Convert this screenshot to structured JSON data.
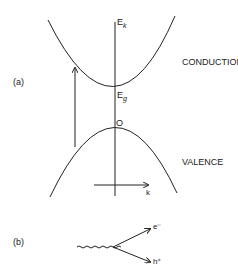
{
  "panel_a": {
    "label": "(a)",
    "energy_axis_label": "E",
    "energy_axis_sub": "k",
    "gap_label": "E",
    "gap_sub": "g",
    "origin_label": "O",
    "k_axis_label": "k",
    "conduction_label": "CONDUCTION",
    "valence_label": "VALENCE"
  },
  "panel_b": {
    "label": "(b)",
    "electron_label": "e⁻",
    "hole_label": "h⁺"
  },
  "colors": {
    "stroke": "#222222",
    "background": "#ffffff"
  }
}
